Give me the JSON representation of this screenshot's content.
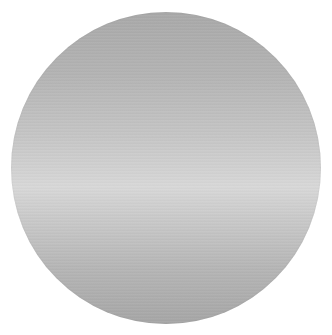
{
  "image": {
    "subject": "silver metallic disc",
    "shape": "circle",
    "colors": {
      "top": "#a9a9a9",
      "highlight": "#d8d8d8",
      "bottom": "#a6a6a6",
      "background": "#ffffff"
    }
  }
}
